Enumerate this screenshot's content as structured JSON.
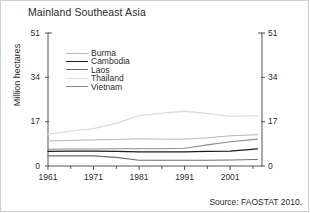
{
  "chart_data": {
    "type": "line",
    "title": "Mainland Southeast Asia",
    "xlabel": "",
    "ylabel": "Million hectares",
    "source": "Source: FAOSTAT 2010.",
    "xlim": [
      1961,
      2008
    ],
    "ylim": [
      0,
      51
    ],
    "yticks": [
      0,
      17,
      34,
      51
    ],
    "yticks_right": [
      0,
      17,
      34,
      51
    ],
    "xticks": [
      1961,
      1971,
      1981,
      1991,
      2001
    ],
    "xminor_step": 5,
    "grid": false,
    "legend_position": "inside-upper-left",
    "x": [
      1961,
      1966,
      1971,
      1976,
      1981,
      1986,
      1991,
      1996,
      2001,
      2007
    ],
    "series": [
      {
        "name": "Burma",
        "color": "#b8b8b8",
        "width": 1.0,
        "values": [
          9.6,
          9.8,
          10.0,
          10.2,
          10.4,
          10.3,
          10.3,
          10.8,
          11.6,
          12.0
        ]
      },
      {
        "name": "Cambodia",
        "color": "#1a1a1a",
        "width": 1.2,
        "values": [
          5.6,
          5.7,
          5.7,
          5.6,
          5.4,
          5.4,
          5.4,
          5.6,
          5.7,
          6.6
        ]
      },
      {
        "name": "Laos",
        "color": "#6e6e6e",
        "width": 1.1,
        "values": [
          3.9,
          3.9,
          3.9,
          3.3,
          2.2,
          2.2,
          2.2,
          2.2,
          2.3,
          2.5
        ]
      },
      {
        "name": "Thailand",
        "color": "#dcdcdc",
        "width": 1.3,
        "values": [
          12.1,
          13.4,
          14.3,
          16.4,
          19.2,
          20.3,
          21.0,
          20.2,
          19.0,
          19.3
        ]
      },
      {
        "name": "Vietnam",
        "color": "#8c8c8c",
        "width": 1.1,
        "values": [
          6.4,
          6.5,
          6.5,
          6.6,
          6.6,
          6.6,
          6.8,
          8.1,
          9.3,
          10.3
        ]
      }
    ]
  }
}
